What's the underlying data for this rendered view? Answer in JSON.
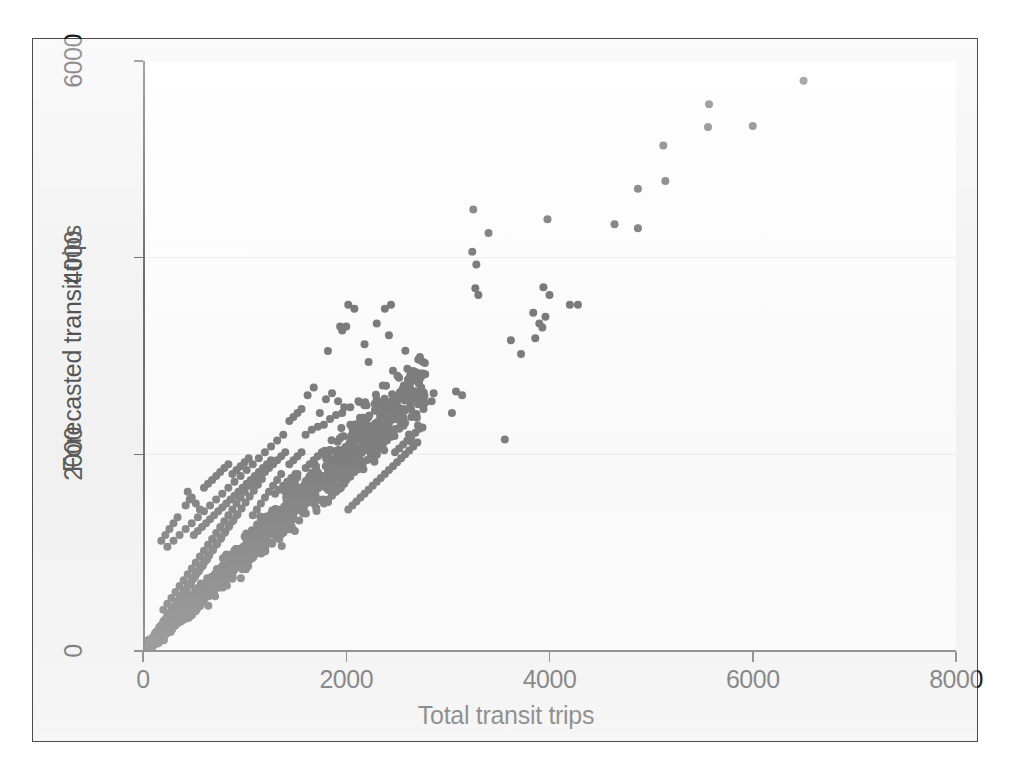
{
  "figure": {
    "background_color": "#f3f3f3",
    "plot_background_color": "#ffffff",
    "frame_color": "#4b4b4b",
    "marker_color": "#515151",
    "gridline_color": "#c8c8c8"
  },
  "chart_data": {
    "type": "scatter",
    "title": "",
    "xlabel": "Total transit trips",
    "ylabel": "Forecasted transit trips",
    "xlim": [
      0,
      8000
    ],
    "ylim": [
      0,
      6000
    ],
    "xticks": [
      0,
      2000,
      4000,
      6000,
      8000
    ],
    "yticks": [
      0,
      2000,
      4000,
      6000
    ],
    "xtick_labels": [
      "0",
      "2000",
      "4000",
      "6000",
      "8000"
    ],
    "ytick_labels": [
      "0",
      "2000",
      "4000",
      "6000"
    ],
    "grid": "horizontal-faint",
    "legend": "none",
    "marker": "circle",
    "marker_size_px": 8,
    "n_points_approx": 1800,
    "relationship": "strong positive, approximately identity line y = x with widening scatter",
    "points": [
      [
        6500,
        5800
      ],
      [
        5570,
        5560
      ],
      [
        5560,
        5330
      ],
      [
        6000,
        5340
      ],
      [
        5120,
        5140
      ],
      [
        5140,
        4780
      ],
      [
        4870,
        4700
      ],
      [
        4640,
        4340
      ],
      [
        4870,
        4300
      ],
      [
        4280,
        3520
      ],
      [
        4200,
        3520
      ],
      [
        3980,
        4390
      ],
      [
        3250,
        4490
      ],
      [
        3400,
        4250
      ],
      [
        3240,
        4060
      ],
      [
        3280,
        3930
      ],
      [
        3270,
        3690
      ],
      [
        3300,
        3620
      ],
      [
        3940,
        3700
      ],
      [
        4000,
        3620
      ],
      [
        3960,
        3400
      ],
      [
        3900,
        3330
      ],
      [
        3840,
        3440
      ],
      [
        3930,
        3290
      ],
      [
        3860,
        3180
      ],
      [
        3720,
        3020
      ],
      [
        3620,
        3160
      ],
      [
        3560,
        2150
      ],
      [
        2020,
        3520
      ],
      [
        2080,
        3480
      ],
      [
        2380,
        3480
      ],
      [
        2440,
        3520
      ],
      [
        2300,
        3330
      ],
      [
        2420,
        3210
      ],
      [
        1940,
        3300
      ],
      [
        1960,
        3260
      ],
      [
        2000,
        3300
      ],
      [
        2180,
        3120
      ],
      [
        1820,
        3050
      ],
      [
        2220,
        2940
      ],
      [
        2540,
        2640
      ],
      [
        2600,
        2700
      ],
      [
        2680,
        2640
      ],
      [
        2860,
        2620
      ],
      [
        3080,
        2640
      ],
      [
        3140,
        2600
      ],
      [
        3040,
        2420
      ],
      [
        2840,
        2540
      ],
      [
        2760,
        2460
      ],
      [
        2460,
        2850
      ],
      [
        2520,
        2780
      ],
      [
        2360,
        2700
      ],
      [
        2300,
        2560
      ],
      [
        2200,
        2500
      ],
      [
        2120,
        2540
      ],
      [
        2040,
        2480
      ],
      [
        1960,
        2420
      ],
      [
        1900,
        2400
      ],
      [
        1840,
        2360
      ],
      [
        1780,
        2300
      ],
      [
        1720,
        2280
      ],
      [
        1660,
        2250
      ],
      [
        1600,
        2200
      ],
      [
        1560,
        2460
      ],
      [
        1520,
        2420
      ],
      [
        1480,
        2380
      ],
      [
        1620,
        2600
      ],
      [
        1680,
        2680
      ],
      [
        1740,
        2420
      ],
      [
        1800,
        2560
      ],
      [
        1860,
        2620
      ],
      [
        1920,
        2540
      ],
      [
        1980,
        2480
      ],
      [
        2040,
        2300
      ],
      [
        2100,
        2240
      ],
      [
        2160,
        2180
      ],
      [
        2220,
        2140
      ],
      [
        2280,
        2300
      ],
      [
        2340,
        2360
      ],
      [
        2400,
        2420
      ],
      [
        2460,
        2200
      ],
      [
        2520,
        2260
      ],
      [
        2580,
        2320
      ],
      [
        2640,
        2380
      ],
      [
        1440,
        2340
      ],
      [
        1380,
        2200
      ],
      [
        1320,
        2140
      ],
      [
        1260,
        2080
      ],
      [
        1200,
        2020
      ],
      [
        1140,
        1960
      ],
      [
        1080,
        1900
      ],
      [
        1020,
        1840
      ],
      [
        960,
        1780
      ],
      [
        900,
        1720
      ],
      [
        840,
        1660
      ],
      [
        780,
        1600
      ],
      [
        720,
        1540
      ],
      [
        660,
        1480
      ],
      [
        600,
        1420
      ],
      [
        540,
        1360
      ],
      [
        480,
        1300
      ],
      [
        420,
        1240
      ],
      [
        360,
        1180
      ],
      [
        300,
        1120
      ],
      [
        240,
        1060
      ],
      [
        440,
        1620
      ],
      [
        480,
        1560
      ],
      [
        520,
        1500
      ],
      [
        560,
        1440
      ],
      [
        600,
        1660
      ],
      [
        640,
        1700
      ],
      [
        680,
        1740
      ],
      [
        720,
        1780
      ],
      [
        760,
        1820
      ],
      [
        800,
        1860
      ],
      [
        840,
        1900
      ],
      [
        880,
        1800
      ],
      [
        920,
        1840
      ],
      [
        960,
        1880
      ],
      [
        1000,
        1920
      ],
      [
        1040,
        1960
      ],
      [
        1080,
        1700
      ],
      [
        1120,
        1740
      ],
      [
        1160,
        1780
      ],
      [
        1200,
        1820
      ],
      [
        1240,
        1860
      ],
      [
        1280,
        1900
      ],
      [
        1320,
        1940
      ],
      [
        1360,
        1980
      ],
      [
        1400,
        2020
      ],
      [
        1440,
        1900
      ],
      [
        1480,
        1940
      ],
      [
        1520,
        1980
      ],
      [
        1560,
        2020
      ],
      [
        1600,
        1860
      ],
      [
        1640,
        1900
      ],
      [
        1680,
        1940
      ],
      [
        1720,
        1980
      ],
      [
        1760,
        2020
      ],
      [
        1800,
        1780
      ],
      [
        1840,
        1820
      ],
      [
        1880,
        1860
      ],
      [
        1920,
        1900
      ],
      [
        1960,
        1940
      ],
      [
        2000,
        1980
      ],
      [
        2040,
        2020
      ],
      [
        200,
        420
      ],
      [
        240,
        480
      ],
      [
        280,
        540
      ],
      [
        320,
        600
      ],
      [
        360,
        660
      ],
      [
        400,
        720
      ],
      [
        440,
        780
      ],
      [
        480,
        840
      ],
      [
        520,
        900
      ],
      [
        560,
        960
      ],
      [
        600,
        1020
      ],
      [
        640,
        1080
      ],
      [
        680,
        1140
      ],
      [
        720,
        1200
      ],
      [
        760,
        1260
      ],
      [
        800,
        1320
      ],
      [
        840,
        1380
      ],
      [
        880,
        1440
      ],
      [
        920,
        1500
      ],
      [
        960,
        1560
      ],
      [
        1000,
        1620
      ],
      [
        1040,
        1680
      ],
      [
        1080,
        1380
      ],
      [
        1120,
        1440
      ],
      [
        1160,
        1500
      ],
      [
        1200,
        1560
      ],
      [
        1240,
        1620
      ],
      [
        1280,
        1680
      ],
      [
        1320,
        1740
      ],
      [
        1360,
        1800
      ],
      [
        1400,
        1620
      ],
      [
        1440,
        1680
      ],
      [
        1480,
        1740
      ],
      [
        1520,
        1800
      ],
      [
        1560,
        1660
      ],
      [
        1600,
        1720
      ],
      [
        1640,
        1780
      ],
      [
        1680,
        1660
      ],
      [
        1720,
        1720
      ],
      [
        1760,
        1780
      ],
      [
        1800,
        1660
      ],
      [
        1840,
        1700
      ],
      [
        1880,
        1740
      ],
      [
        1920,
        1780
      ],
      [
        1960,
        1700
      ],
      [
        2000,
        1740
      ],
      [
        2040,
        1780
      ],
      [
        2080,
        1820
      ],
      [
        2120,
        1860
      ],
      [
        2160,
        1900
      ],
      [
        2200,
        1940
      ],
      [
        2240,
        1980
      ],
      [
        2280,
        2020
      ],
      [
        2320,
        2060
      ],
      [
        2360,
        2100
      ],
      [
        2400,
        2140
      ],
      [
        2440,
        2180
      ],
      [
        2480,
        2020
      ],
      [
        2520,
        2060
      ],
      [
        2560,
        2100
      ],
      [
        2600,
        2140
      ],
      [
        2640,
        2180
      ],
      [
        2680,
        2220
      ],
      [
        2720,
        2260
      ],
      [
        100,
        140
      ],
      [
        140,
        200
      ],
      [
        180,
        260
      ],
      [
        220,
        320
      ],
      [
        260,
        380
      ],
      [
        300,
        440
      ],
      [
        340,
        500
      ],
      [
        380,
        560
      ],
      [
        60,
        80
      ],
      [
        80,
        120
      ],
      [
        120,
        180
      ],
      [
        160,
        240
      ],
      [
        200,
        300
      ],
      [
        240,
        360
      ],
      [
        280,
        420
      ],
      [
        320,
        480
      ],
      [
        360,
        540
      ],
      [
        400,
        600
      ],
      [
        440,
        660
      ],
      [
        480,
        720
      ],
      [
        520,
        780
      ],
      [
        560,
        840
      ],
      [
        600,
        900
      ],
      [
        640,
        960
      ],
      [
        680,
        1020
      ],
      [
        720,
        1080
      ],
      [
        760,
        1140
      ],
      [
        800,
        1200
      ],
      [
        840,
        1260
      ],
      [
        880,
        1320
      ],
      [
        920,
        1380
      ],
      [
        40,
        60
      ],
      [
        70,
        100
      ],
      [
        110,
        150
      ],
      [
        150,
        210
      ],
      [
        190,
        270
      ],
      [
        230,
        330
      ],
      [
        270,
        390
      ],
      [
        310,
        450
      ],
      [
        350,
        510
      ],
      [
        390,
        570
      ],
      [
        430,
        630
      ],
      [
        470,
        690
      ],
      [
        510,
        750
      ],
      [
        550,
        810
      ],
      [
        590,
        870
      ],
      [
        630,
        930
      ],
      [
        20,
        30
      ],
      [
        50,
        70
      ],
      [
        90,
        130
      ],
      [
        130,
        190
      ],
      [
        170,
        250
      ],
      [
        210,
        310
      ],
      [
        250,
        370
      ],
      [
        290,
        430
      ],
      [
        330,
        490
      ],
      [
        370,
        550
      ],
      [
        410,
        610
      ],
      [
        450,
        670
      ],
      [
        490,
        730
      ],
      [
        530,
        790
      ],
      [
        570,
        850
      ],
      [
        610,
        910
      ],
      [
        650,
        970
      ],
      [
        690,
        1030
      ],
      [
        730,
        1090
      ],
      [
        770,
        1150
      ],
      [
        810,
        1210
      ],
      [
        850,
        1270
      ],
      [
        890,
        1330
      ],
      [
        930,
        1390
      ],
      [
        970,
        1450
      ],
      [
        1010,
        1510
      ],
      [
        1050,
        1570
      ],
      [
        1090,
        1630
      ],
      [
        1130,
        1690
      ],
      [
        1170,
        1750
      ],
      [
        300,
        1300
      ],
      [
        340,
        1360
      ],
      [
        260,
        1240
      ],
      [
        220,
        1180
      ],
      [
        180,
        1120
      ],
      [
        420,
        1480
      ],
      [
        460,
        1540
      ],
      [
        500,
        1180
      ],
      [
        540,
        1220
      ],
      [
        580,
        1260
      ],
      [
        620,
        1300
      ],
      [
        660,
        1340
      ],
      [
        700,
        1380
      ],
      [
        740,
        1420
      ],
      [
        780,
        1460
      ],
      [
        820,
        1500
      ],
      [
        860,
        1540
      ],
      [
        900,
        1580
      ],
      [
        940,
        1620
      ],
      [
        980,
        1660
      ],
      [
        1020,
        1700
      ],
      [
        1060,
        1740
      ],
      [
        1100,
        1780
      ],
      [
        1140,
        1820
      ],
      [
        1180,
        1860
      ],
      [
        1220,
        1900
      ],
      [
        1260,
        1940
      ],
      [
        1300,
        1600
      ],
      [
        1340,
        1640
      ],
      [
        1380,
        1680
      ],
      [
        1420,
        1720
      ],
      [
        1460,
        1760
      ],
      [
        1500,
        1800
      ],
      [
        1540,
        1560
      ],
      [
        1580,
        1600
      ],
      [
        1620,
        1640
      ],
      [
        1660,
        1680
      ],
      [
        1700,
        1720
      ],
      [
        1740,
        1760
      ],
      [
        1780,
        1500
      ],
      [
        1820,
        1540
      ],
      [
        1860,
        1580
      ],
      [
        1900,
        1620
      ],
      [
        1940,
        1660
      ],
      [
        1980,
        1700
      ],
      [
        2020,
        1440
      ],
      [
        2060,
        1480
      ],
      [
        2100,
        1520
      ],
      [
        2140,
        1560
      ],
      [
        2180,
        1600
      ],
      [
        2220,
        1640
      ],
      [
        2260,
        1680
      ],
      [
        2300,
        1720
      ],
      [
        2340,
        1760
      ],
      [
        2380,
        1800
      ],
      [
        2420,
        1840
      ],
      [
        2460,
        1880
      ],
      [
        2500,
        1920
      ],
      [
        2540,
        1960
      ],
      [
        2580,
        2000
      ],
      [
        2620,
        2040
      ],
      [
        2660,
        2080
      ],
      [
        2700,
        2120
      ]
    ]
  }
}
